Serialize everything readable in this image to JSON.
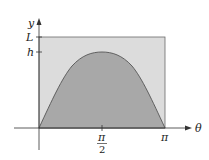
{
  "diagram": {
    "type": "area-under-curve",
    "axes": {
      "x_label": "θ",
      "y_label": "y"
    },
    "y_ticks": [
      {
        "label": "L",
        "value": "L"
      },
      {
        "label": "h",
        "value": "h"
      }
    ],
    "x_ticks": [
      {
        "label_num": "π",
        "label_den": "2",
        "value": "π/2"
      },
      {
        "label": "π",
        "value": "π"
      }
    ],
    "colors": {
      "rectangle_fill": "#dcdcdc",
      "curve_fill": "#a8a8a8",
      "stroke": "#555555",
      "axis": "#333333"
    }
  }
}
